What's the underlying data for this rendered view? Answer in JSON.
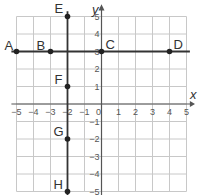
{
  "graph": {
    "x_axis_label": "x",
    "y_axis_label": "y",
    "x_range": [
      -5,
      5
    ],
    "y_range": [
      -5,
      5
    ],
    "x_ticks": [
      "-5",
      "-4",
      "-3",
      "-2",
      "-1",
      "0",
      "1",
      "2",
      "3",
      "4",
      "5"
    ],
    "y_ticks": [
      "5",
      "4",
      "3",
      "2",
      "1",
      "-1",
      "-2",
      "-3",
      "-4",
      "-5"
    ],
    "horizontal_line": {
      "y": 3,
      "x_from": -5.3,
      "x_to": 5.2
    },
    "vertical_line": {
      "x": -2,
      "y_from": 5.3,
      "y_to": -5.5
    },
    "points": [
      {
        "label": "A",
        "x": -5,
        "y": 3
      },
      {
        "label": "B",
        "x": -3,
        "y": 3
      },
      {
        "label": "C",
        "x": 0,
        "y": 3
      },
      {
        "label": "D",
        "x": 4,
        "y": 3
      },
      {
        "label": "E",
        "x": -2,
        "y": 5
      },
      {
        "label": "F",
        "x": -2,
        "y": 1
      },
      {
        "label": "G",
        "x": -2,
        "y": -2
      },
      {
        "label": "H",
        "x": -2,
        "y": -5
      }
    ],
    "colors": {
      "grid": "#c8c8c8",
      "axis": "#555555",
      "line": "#333333",
      "point": "#222222",
      "label": "#333333"
    }
  }
}
